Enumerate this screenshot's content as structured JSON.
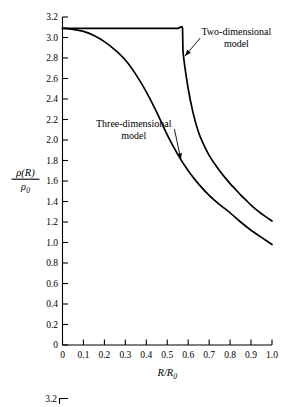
{
  "chart_data": {
    "type": "line",
    "title": "",
    "xlabel": "R/R0",
    "xlabel_parts": {
      "num": "R",
      "den_base": "R",
      "den_sub": "0"
    },
    "ylabel": "ρ(R)/ρ0",
    "ylabel_parts": {
      "num_base": "ρ(R)",
      "den_base": "ρ",
      "den_sub": "0"
    },
    "xlim": [
      0,
      1.0
    ],
    "ylim": [
      0,
      3.2
    ],
    "xticks": [
      "0",
      "0.1",
      "0.2",
      "0.3",
      "0.4",
      "0.5",
      "0.6",
      "0.7",
      "0.8",
      "0.9",
      "1.0"
    ],
    "xtick_values": [
      0,
      0.1,
      0.2,
      0.3,
      0.4,
      0.5,
      0.6,
      0.7,
      0.8,
      0.9,
      1.0
    ],
    "yticks": [
      "0",
      "0.2",
      "0.4",
      "0.6",
      "0.8",
      "1.0",
      "1.2",
      "1.4",
      "1.6",
      "1.8",
      "2.0",
      "2.2",
      "2.4",
      "2.6",
      "2.8",
      "3.0",
      "3.2"
    ],
    "ytick_values": [
      0,
      0.2,
      0.4,
      0.6,
      0.8,
      1.0,
      1.2,
      1.4,
      1.6,
      1.8,
      2.0,
      2.2,
      2.4,
      2.6,
      2.8,
      3.0,
      3.2
    ],
    "grid": false,
    "legend_position": "inline-annotations",
    "series": [
      {
        "name": "Two-dimensional model",
        "x": [
          0.0,
          0.05,
          0.1,
          0.15,
          0.2,
          0.25,
          0.3,
          0.35,
          0.4,
          0.45,
          0.5,
          0.55,
          0.573,
          0.575,
          0.6,
          0.625,
          0.65,
          0.675,
          0.7,
          0.725,
          0.75,
          0.775,
          0.8,
          0.825,
          0.85,
          0.875,
          0.9,
          0.925,
          0.95,
          0.975,
          1.0
        ],
        "y": [
          3.09,
          3.09,
          3.09,
          3.09,
          3.09,
          3.09,
          3.09,
          3.09,
          3.09,
          3.09,
          3.09,
          3.09,
          3.09,
          2.87,
          2.5,
          2.25,
          2.07,
          1.95,
          1.85,
          1.77,
          1.7,
          1.635,
          1.575,
          1.52,
          1.465,
          1.415,
          1.365,
          1.32,
          1.28,
          1.245,
          1.21
        ]
      },
      {
        "name": "Three-dimensional model",
        "x": [
          0.0,
          0.05,
          0.1,
          0.15,
          0.2,
          0.25,
          0.3,
          0.35,
          0.4,
          0.45,
          0.5,
          0.55,
          0.6,
          0.65,
          0.7,
          0.75,
          0.8,
          0.85,
          0.9,
          0.95,
          1.0
        ],
        "y": [
          3.09,
          3.08,
          3.06,
          3.02,
          2.96,
          2.88,
          2.78,
          2.64,
          2.47,
          2.27,
          2.05,
          1.86,
          1.7,
          1.57,
          1.46,
          1.37,
          1.29,
          1.2,
          1.12,
          1.05,
          0.98
        ]
      }
    ],
    "annotations": [
      {
        "id": "two-dimensional-model",
        "line1": "Two-dimensional",
        "line2": "model",
        "text_x": 0.83,
        "text_y": 3.02,
        "arrow_target_x": 0.585,
        "arrow_target_y": 2.82
      },
      {
        "id": "three-dimensional-model",
        "line1": "Three-dimensional",
        "line2": "model",
        "text_x": 0.34,
        "text_y": 2.13,
        "arrow_target_x": 0.565,
        "arrow_target_y": 1.81
      }
    ]
  },
  "fragment": {
    "partial_tick_label": "3.2"
  }
}
